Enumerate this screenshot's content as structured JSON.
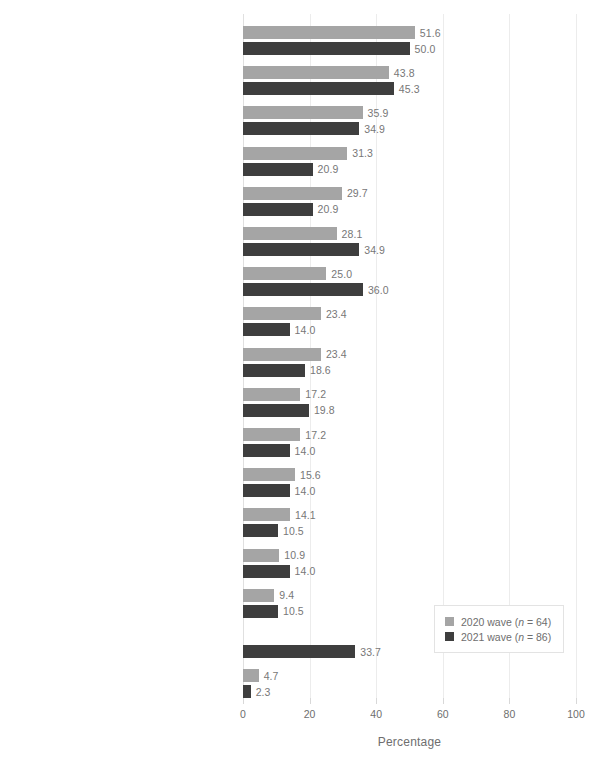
{
  "chart_data": {
    "type": "bar",
    "orientation": "horizontal",
    "grouped": true,
    "title": "",
    "xlabel": "Percentage",
    "ylabel": "",
    "xlim": [
      0,
      100
    ],
    "xticks": [
      "0",
      "20",
      "40",
      "60",
      "80",
      "100"
    ],
    "grid": "vertical",
    "legend_position": "lower-right",
    "categories": [
      "Own physical or behavioral health conditions",
      "Managing family needs",
      "Relationship challenges",
      "Changing geographic locations",
      "Disruptions in work history",
      "Family's physical or behavioral health conditions",
      "Challenges maintaining connections with people",
      "Other",
      "Caregiver responsibilities",
      "Challenges securing funding for my business",
      "Current credit status or lack of savings",
      "Concerns about maintaining my disability benefits",
      "Lack of understanding of needs in the workplace",
      "Unfair treatment due to personal characteristics",
      "Lack of understanding of skills in the workplace",
      "COVID-19 related challenges",
      "None"
    ],
    "category_footnotes": [
      "",
      "",
      "",
      "",
      "",
      "",
      "",
      "a",
      "",
      "",
      "",
      "",
      "",
      "",
      "",
      "b",
      ""
    ],
    "series": [
      {
        "name": "2020 wave (n = 64)",
        "color": "#a5a5a5",
        "values": [
          51.6,
          43.8,
          35.9,
          31.3,
          29.7,
          28.1,
          25.0,
          23.4,
          23.4,
          17.2,
          17.2,
          15.6,
          14.1,
          10.9,
          9.4,
          null,
          4.7
        ],
        "labels": [
          "51.6",
          "43.8",
          "35.9",
          "31.3",
          "29.7",
          "28.1",
          "25.0",
          "23.4",
          "23.4",
          "17.2",
          "17.2",
          "15.6",
          "14.1",
          "10.9",
          "9.4",
          "",
          "4.7"
        ]
      },
      {
        "name": "2021 wave (n = 86)",
        "color": "#3e3e3e",
        "values": [
          50.0,
          45.3,
          34.9,
          20.9,
          20.9,
          34.9,
          36.0,
          14.0,
          18.6,
          19.8,
          14.0,
          14.0,
          10.5,
          14.0,
          10.5,
          33.7,
          2.3
        ],
        "labels": [
          "50.0",
          "45.3",
          "34.9",
          "20.9",
          "20.9",
          "34.9",
          "36.0",
          "14.0",
          "18.6",
          "19.8",
          "14.0",
          "14.0",
          "10.5",
          "14.0",
          "10.5",
          "33.7",
          "2.3"
        ]
      }
    ]
  },
  "legend": {
    "items": [
      {
        "label_prefix": "2020 wave (",
        "label_n": "n",
        "label_suffix": " = 64)"
      },
      {
        "label_prefix": "2021 wave (",
        "label_n": "n",
        "label_suffix": " = 86)"
      }
    ]
  },
  "axis": {
    "title": "Percentage"
  }
}
